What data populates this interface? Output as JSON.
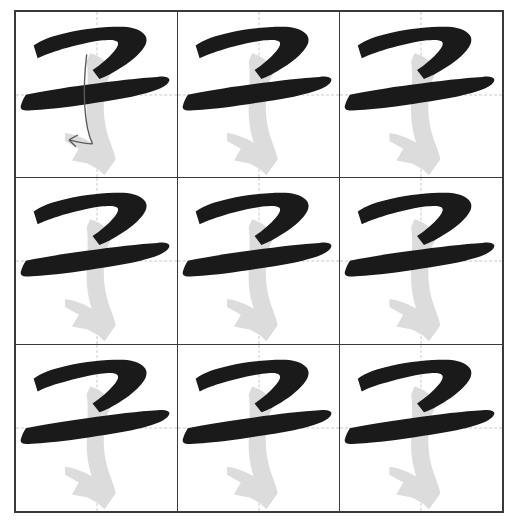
{
  "worksheet": {
    "title": "Chinese character stroke-order practice sheet",
    "character": "子",
    "pinyin": "zǐ",
    "grid": {
      "rows": 3,
      "columns": 3,
      "cell_count": 9,
      "guide_style": "dashed cross (mi zi ge center lines)",
      "border_color": "#3a3a3a",
      "guide_color": "#c9c9c9",
      "background_color": "#ffffff"
    },
    "ink": {
      "completed_stroke_color": "#1a1a1a",
      "current_stroke_color": "#dcdcdc",
      "direction_arrow_color": "#5a5a5a"
    },
    "strokes": [
      {
        "index": 1,
        "name": "heng-pie",
        "label": "横撇",
        "state": "completed",
        "color": "#1a1a1a"
      },
      {
        "index": 2,
        "name": "heng",
        "label": "横",
        "state": "completed",
        "color": "#1a1a1a"
      },
      {
        "index": 3,
        "name": "shu-gou",
        "label": "竖钩",
        "state": "current",
        "color": "#dcdcdc"
      }
    ],
    "cells": [
      {
        "position": 1,
        "row": 1,
        "column": 1,
        "character": "子",
        "highlighted_stroke": 3,
        "show_direction_arrow": true
      },
      {
        "position": 2,
        "row": 1,
        "column": 2,
        "character": "子",
        "highlighted_stroke": 3,
        "show_direction_arrow": false
      },
      {
        "position": 3,
        "row": 1,
        "column": 3,
        "character": "子",
        "highlighted_stroke": 3,
        "show_direction_arrow": false
      },
      {
        "position": 4,
        "row": 2,
        "column": 1,
        "character": "子",
        "highlighted_stroke": 3,
        "show_direction_arrow": false
      },
      {
        "position": 5,
        "row": 2,
        "column": 2,
        "character": "子",
        "highlighted_stroke": 3,
        "show_direction_arrow": false
      },
      {
        "position": 6,
        "row": 2,
        "column": 3,
        "character": "子",
        "highlighted_stroke": 3,
        "show_direction_arrow": false
      },
      {
        "position": 7,
        "row": 3,
        "column": 1,
        "character": "子",
        "highlighted_stroke": 3,
        "show_direction_arrow": false
      },
      {
        "position": 8,
        "row": 3,
        "column": 2,
        "character": "子",
        "highlighted_stroke": 3,
        "show_direction_arrow": false
      },
      {
        "position": 9,
        "row": 3,
        "column": 3,
        "character": "子",
        "highlighted_stroke": 3,
        "show_direction_arrow": false
      }
    ]
  }
}
